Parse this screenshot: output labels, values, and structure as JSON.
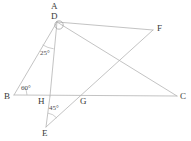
{
  "figure": {
    "type": "geometry-diagram",
    "background_color": "#ffffff",
    "line_color": "#b4b4b4",
    "label_color": "#3a3a3a",
    "width": 191,
    "height": 141,
    "points": [
      {
        "id": "A",
        "label": "A",
        "x": 57,
        "y": 12,
        "label_x": 51,
        "label_y": 2,
        "is_vertex": false
      },
      {
        "id": "D",
        "label": "D",
        "x": 57,
        "y": 22,
        "label_x": 51,
        "label_y": 12,
        "is_vertex": true
      },
      {
        "id": "F",
        "label": "F",
        "x": 153,
        "y": 30,
        "label_x": 157,
        "label_y": 24,
        "is_vertex": true
      },
      {
        "id": "B",
        "label": "B",
        "x": 14,
        "y": 95,
        "label_x": 4,
        "label_y": 92,
        "is_vertex": true
      },
      {
        "id": "H",
        "label": "H",
        "x": 50,
        "y": 96,
        "label_x": 38,
        "label_y": 97,
        "is_vertex": true
      },
      {
        "id": "G",
        "label": "G",
        "x": 86,
        "y": 96,
        "label_x": 80,
        "label_y": 97,
        "is_vertex": true
      },
      {
        "id": "C",
        "label": "C",
        "x": 177,
        "y": 96,
        "label_x": 180,
        "label_y": 92,
        "is_vertex": true
      },
      {
        "id": "E",
        "label": "E",
        "x": 46,
        "y": 127,
        "label_x": 42,
        "label_y": 129,
        "is_vertex": true
      }
    ],
    "segments": [
      {
        "name": "segment-B-D",
        "from": "B",
        "to": "D"
      },
      {
        "name": "segment-B-C",
        "from": "B",
        "to": "C"
      },
      {
        "name": "segment-D-H",
        "from": "D",
        "to": "H"
      },
      {
        "name": "segment-D-F",
        "from": "D",
        "to": "F"
      },
      {
        "name": "segment-D-C",
        "from": "D",
        "to": "C"
      },
      {
        "name": "segment-E-F",
        "from": "E",
        "to": "F"
      },
      {
        "name": "segment-E-H",
        "from": "E",
        "to": "H"
      }
    ],
    "angles": [
      {
        "name": "angle-at-B",
        "label": "60°",
        "label_x": 21,
        "label_y": 85,
        "arc": {
          "cx": 14,
          "cy": 95,
          "r": 13,
          "start": -40,
          "end": 0
        }
      },
      {
        "name": "angle-at-D",
        "label": "25°",
        "label_x": 40,
        "label_y": 50,
        "arc": {
          "cx": 57,
          "cy": 22,
          "r": 27,
          "start": 97,
          "end": 122
        }
      },
      {
        "name": "angle-at-E",
        "label": "45°",
        "label_x": 49,
        "label_y": 105,
        "arc": {
          "cx": 46,
          "cy": 127,
          "r": 14,
          "start": -82,
          "end": -40
        }
      }
    ],
    "vertex_marker": {
      "name": "right-angle-marker-at-D",
      "cx": 59,
      "cy": 25,
      "r": 4.2
    }
  }
}
